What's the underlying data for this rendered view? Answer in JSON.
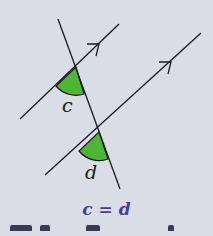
{
  "diagram": {
    "angle_labels": {
      "upper": "c",
      "lower": "d"
    },
    "equation": "c = d",
    "colors": {
      "angle_fill": "#4fb535",
      "line": "#1a1a1a",
      "equation": "#4a3f8a",
      "background": "#d9dde6"
    }
  }
}
